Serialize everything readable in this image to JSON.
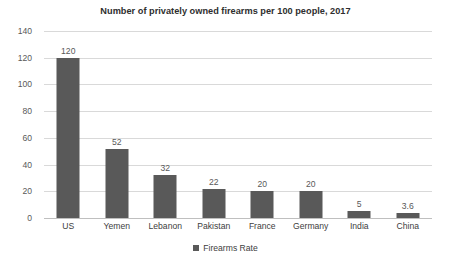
{
  "chart_data": {
    "type": "bar",
    "title": "Number of privately owned firearms per 100 people, 2017",
    "xlabel": "",
    "ylabel": "",
    "categories": [
      "US",
      "Yemen",
      "Lebanon",
      "Pakistan",
      "France",
      "Germany",
      "India",
      "China"
    ],
    "values": [
      120,
      52,
      32,
      22,
      20,
      20,
      5,
      3.6
    ],
    "value_labels": [
      "120",
      "52",
      "32",
      "22",
      "20",
      "20",
      "5",
      "3.6"
    ],
    "series": [
      {
        "name": "Firearms Rate",
        "values": [
          120,
          52,
          32,
          22,
          20,
          20,
          5,
          3.6
        ],
        "color": "#595959"
      }
    ],
    "ylim": [
      0,
      140
    ],
    "yticks": [
      0,
      20,
      40,
      60,
      80,
      100,
      120,
      140
    ],
    "ytick_labels": [
      "0",
      "20",
      "40",
      "60",
      "80",
      "100",
      "120",
      "140"
    ],
    "grid": true,
    "grid_color": "#d9d9d9",
    "legend": {
      "position": "bottom",
      "entries": [
        {
          "label": "Firearms Rate",
          "color": "#595959"
        }
      ]
    },
    "background_color": "#ffffff",
    "data_labels_shown": true
  }
}
